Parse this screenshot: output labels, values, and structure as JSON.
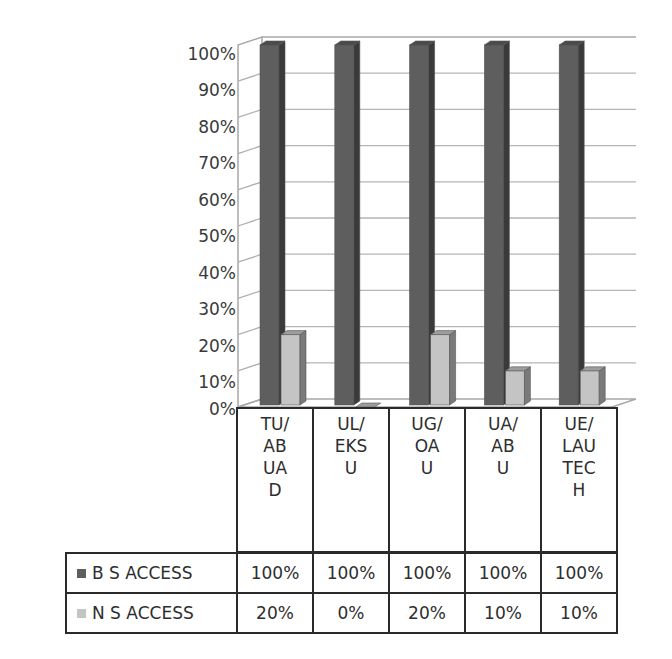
{
  "chart_data": {
    "type": "bar",
    "style": "3d-clustered-column-with-data-table",
    "title": "",
    "xlabel": "",
    "ylabel": "",
    "ylim": [
      0,
      100
    ],
    "y_ticks": [
      "0%",
      "10%",
      "20%",
      "30%",
      "40%",
      "50%",
      "60%",
      "70%",
      "80%",
      "90%",
      "100%"
    ],
    "grid": true,
    "legend_position": "data-table-left",
    "categories": [
      "TU/ABUAD",
      "UL/EKSU",
      "UG/OAU",
      "UA/ABU",
      "UE/LAUTECH"
    ],
    "category_lines": [
      [
        "TU/",
        "AB",
        "UA",
        "D"
      ],
      [
        "UL/",
        "EKS",
        "U"
      ],
      [
        "UG/",
        "OA",
        "U"
      ],
      [
        "UA/",
        "AB",
        "U"
      ],
      [
        "UE/",
        "LAU",
        "TEC",
        "H"
      ]
    ],
    "series": [
      {
        "name": "B S ACCESS",
        "values": [
          100,
          100,
          100,
          100,
          100
        ],
        "labels": [
          "100%",
          "100%",
          "100%",
          "100%",
          "100%"
        ],
        "color": "#5e5e5e"
      },
      {
        "name": "N S ACCESS",
        "values": [
          20,
          0,
          20,
          10,
          10
        ],
        "labels": [
          "20%",
          "0%",
          "20%",
          "10%",
          "10%"
        ],
        "color": "#c4c4c4"
      }
    ]
  }
}
